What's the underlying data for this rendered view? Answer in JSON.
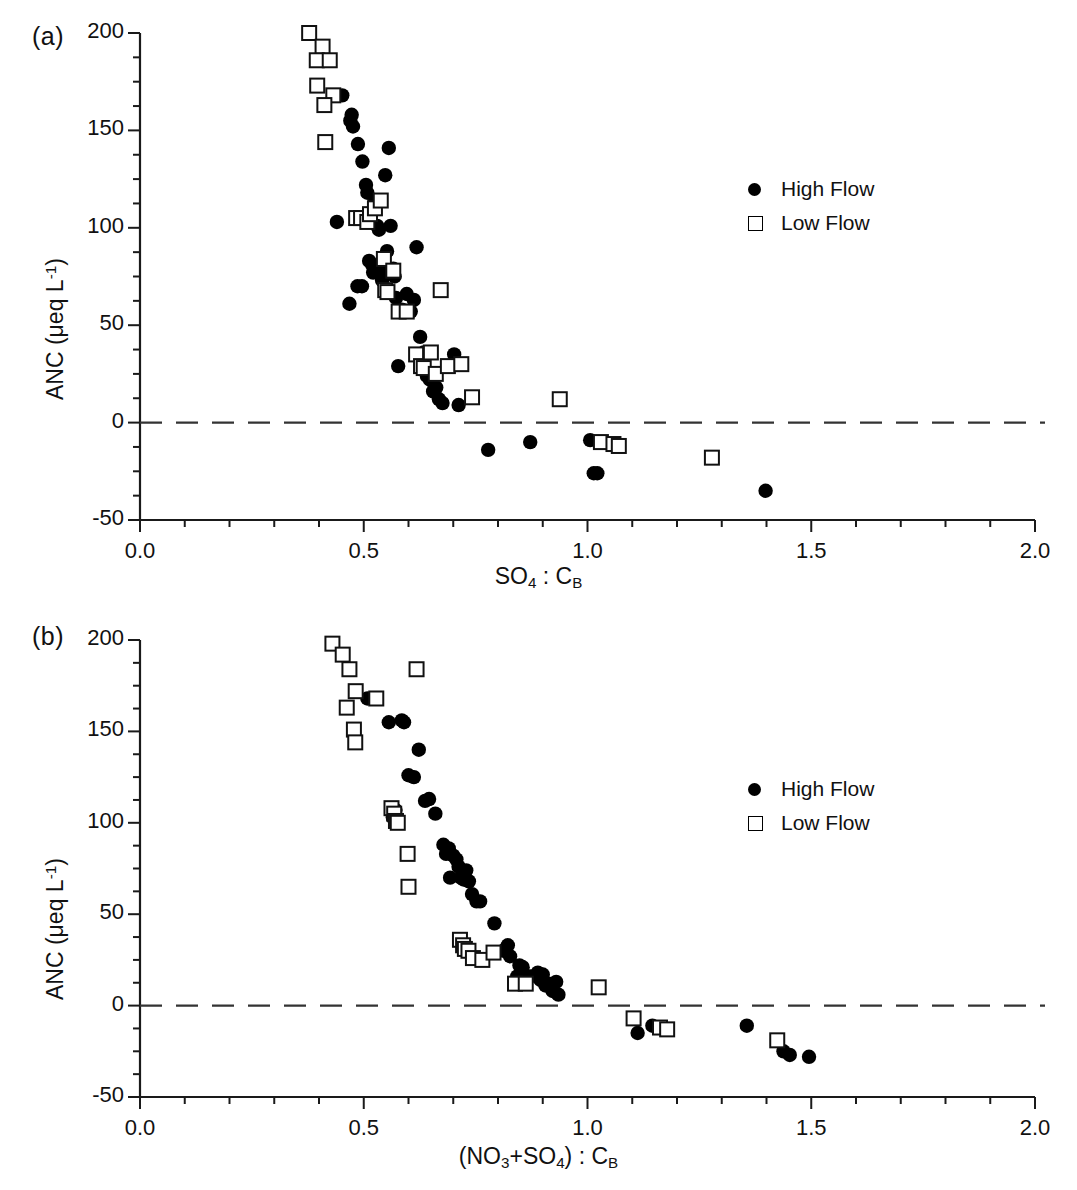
{
  "figure": {
    "background_color": "#ffffff",
    "marker_color": "#000000",
    "zero_line_style": "dashed"
  },
  "panels": [
    {
      "id": "a",
      "label": "(a)",
      "xlabel_html": "SO<sub>4</sub> : C<sub>B</sub>",
      "ylabel_html": "ANC (&#956;eq L<sup>-1</sup>)",
      "legend": [
        {
          "marker": "filled-circle",
          "label": "High Flow"
        },
        {
          "marker": "open-square",
          "label": "Low Flow"
        }
      ],
      "xticks": [
        "0.0",
        "0.5",
        "1.0",
        "1.5",
        "2.0"
      ],
      "yticks": [
        "200",
        "150",
        "100",
        "50",
        "0",
        "-50"
      ]
    },
    {
      "id": "b",
      "label": "(b)",
      "xlabel_html": "(NO<sub>3</sub>+SO<sub>4</sub>) : C<sub>B</sub>",
      "ylabel_html": "ANC (&#956;eq L<sup>-1</sup>)",
      "legend": [
        {
          "marker": "filled-circle",
          "label": "High Flow"
        },
        {
          "marker": "open-square",
          "label": "Low Flow"
        }
      ],
      "xticks": [
        "0.0",
        "0.5",
        "1.0",
        "1.5",
        "2.0"
      ],
      "yticks": [
        "200",
        "150",
        "100",
        "50",
        "0",
        "-50"
      ]
    }
  ],
  "chart_data": [
    {
      "type": "scatter",
      "panel": "a",
      "title": "",
      "xlabel": "SO4 : CB",
      "ylabel": "ANC (ueq L-1)",
      "xlim": [
        0.0,
        2.0
      ],
      "ylim": [
        -50,
        200
      ],
      "xticks": [
        0.0,
        0.5,
        1.0,
        1.5,
        2.0
      ],
      "yticks": [
        -50,
        0,
        50,
        100,
        150,
        200
      ],
      "minor_tick_step_x": 0.1,
      "minor_tick_step_y": 12.5,
      "grid": false,
      "legend_position": "right-upper",
      "zero_reference_line": {
        "y": 0,
        "style": "dashed"
      },
      "series": [
        {
          "name": "High Flow",
          "marker": "filled-circle",
          "points": [
            [
              0.44,
              103
            ],
            [
              0.452,
              168
            ],
            [
              0.47,
              155
            ],
            [
              0.473,
              158
            ],
            [
              0.476,
              152
            ],
            [
              0.468,
              61
            ],
            [
              0.487,
              143
            ],
            [
              0.497,
              134
            ],
            [
              0.496,
              70
            ],
            [
              0.486,
              70
            ],
            [
              0.505,
              122
            ],
            [
              0.508,
              118
            ],
            [
              0.512,
              83
            ],
            [
              0.519,
              81
            ],
            [
              0.521,
              77
            ],
            [
              0.524,
              113
            ],
            [
              0.53,
              101
            ],
            [
              0.534,
              99
            ],
            [
              0.538,
              81
            ],
            [
              0.541,
              73
            ],
            [
              0.545,
              76
            ],
            [
              0.548,
              127
            ],
            [
              0.552,
              88
            ],
            [
              0.556,
              141
            ],
            [
              0.56,
              101
            ],
            [
              0.566,
              79
            ],
            [
              0.569,
              75
            ],
            [
              0.572,
              64
            ],
            [
              0.577,
              29
            ],
            [
              0.585,
              58
            ],
            [
              0.596,
              66
            ],
            [
              0.605,
              57
            ],
            [
              0.612,
              63
            ],
            [
              0.618,
              90
            ],
            [
              0.626,
              44
            ],
            [
              0.634,
              36
            ],
            [
              0.641,
              24
            ],
            [
              0.648,
              22
            ],
            [
              0.655,
              16
            ],
            [
              0.662,
              18
            ],
            [
              0.668,
              12
            ],
            [
              0.676,
              10
            ],
            [
              0.702,
              35
            ],
            [
              0.712,
              9
            ],
            [
              0.778,
              -14
            ],
            [
              0.872,
              -10
            ],
            [
              1.006,
              -9
            ],
            [
              1.014,
              -26
            ],
            [
              1.022,
              -26
            ],
            [
              1.398,
              -35
            ]
          ]
        },
        {
          "name": "Low Flow",
          "marker": "open-square",
          "points": [
            [
              0.378,
              200
            ],
            [
              0.408,
              193
            ],
            [
              0.395,
              186
            ],
            [
              0.424,
              186
            ],
            [
              0.396,
              173
            ],
            [
              0.432,
              168
            ],
            [
              0.412,
              163
            ],
            [
              0.414,
              144
            ],
            [
              0.483,
              105
            ],
            [
              0.494,
              105
            ],
            [
              0.508,
              103
            ],
            [
              0.514,
              107
            ],
            [
              0.525,
              110
            ],
            [
              0.538,
              114
            ],
            [
              0.545,
              84
            ],
            [
              0.548,
              68
            ],
            [
              0.553,
              67
            ],
            [
              0.566,
              78
            ],
            [
              0.578,
              57
            ],
            [
              0.596,
              57
            ],
            [
              0.617,
              35
            ],
            [
              0.628,
              29
            ],
            [
              0.634,
              28
            ],
            [
              0.65,
              36
            ],
            [
              0.661,
              25
            ],
            [
              0.672,
              68
            ],
            [
              0.688,
              29
            ],
            [
              0.718,
              30
            ],
            [
              0.742,
              13
            ],
            [
              0.938,
              12
            ],
            [
              1.03,
              -10
            ],
            [
              1.058,
              -11
            ],
            [
              1.07,
              -12
            ],
            [
              1.278,
              -18
            ]
          ]
        }
      ]
    },
    {
      "type": "scatter",
      "panel": "b",
      "title": "",
      "xlabel": "(NO3+SO4) : CB",
      "ylabel": "ANC (ueq L-1)",
      "xlim": [
        0.0,
        2.0
      ],
      "ylim": [
        -50,
        200
      ],
      "xticks": [
        0.0,
        0.5,
        1.0,
        1.5,
        2.0
      ],
      "yticks": [
        -50,
        0,
        50,
        100,
        150,
        200
      ],
      "minor_tick_step_x": 0.1,
      "minor_tick_step_y": 12.5,
      "grid": false,
      "legend_position": "right-upper",
      "zero_reference_line": {
        "y": 0,
        "style": "dashed"
      },
      "series": [
        {
          "name": "High Flow",
          "marker": "filled-circle",
          "points": [
            [
              0.508,
              168
            ],
            [
              0.556,
              155
            ],
            [
              0.565,
              103
            ],
            [
              0.571,
              107
            ],
            [
              0.585,
              156
            ],
            [
              0.59,
              155
            ],
            [
              0.6,
              126
            ],
            [
              0.612,
              125
            ],
            [
              0.623,
              140
            ],
            [
              0.637,
              112
            ],
            [
              0.646,
              113
            ],
            [
              0.66,
              105
            ],
            [
              0.678,
              88
            ],
            [
              0.684,
              83
            ],
            [
              0.69,
              86
            ],
            [
              0.693,
              70
            ],
            [
              0.7,
              82
            ],
            [
              0.707,
              80
            ],
            [
              0.712,
              76
            ],
            [
              0.717,
              70
            ],
            [
              0.723,
              69
            ],
            [
              0.729,
              74
            ],
            [
              0.735,
              68
            ],
            [
              0.742,
              61
            ],
            [
              0.752,
              57
            ],
            [
              0.76,
              57
            ],
            [
              0.792,
              45
            ],
            [
              0.812,
              30
            ],
            [
              0.822,
              33
            ],
            [
              0.827,
              27
            ],
            [
              0.848,
              22
            ],
            [
              0.855,
              21
            ],
            [
              0.843,
              16
            ],
            [
              0.872,
              16
            ],
            [
              0.889,
              18
            ],
            [
              0.895,
              14
            ],
            [
              0.9,
              17
            ],
            [
              0.906,
              11
            ],
            [
              0.913,
              12
            ],
            [
              0.922,
              8
            ],
            [
              0.93,
              13
            ],
            [
              0.935,
              6
            ],
            [
              1.112,
              -15
            ],
            [
              1.145,
              -11
            ],
            [
              1.356,
              -11
            ],
            [
              1.438,
              -25
            ],
            [
              1.452,
              -27
            ],
            [
              1.495,
              -28
            ]
          ]
        },
        {
          "name": "Low Flow",
          "marker": "open-square",
          "points": [
            [
              0.43,
              198
            ],
            [
              0.453,
              192
            ],
            [
              0.468,
              184
            ],
            [
              0.618,
              184
            ],
            [
              0.482,
              172
            ],
            [
              0.528,
              168
            ],
            [
              0.462,
              163
            ],
            [
              0.478,
              151
            ],
            [
              0.481,
              144
            ],
            [
              0.562,
              108
            ],
            [
              0.568,
              105
            ],
            [
              0.572,
              101
            ],
            [
              0.576,
              100
            ],
            [
              0.598,
              83
            ],
            [
              0.6,
              65
            ],
            [
              0.715,
              36
            ],
            [
              0.722,
              33
            ],
            [
              0.726,
              31
            ],
            [
              0.734,
              30
            ],
            [
              0.744,
              26
            ],
            [
              0.765,
              25
            ],
            [
              0.79,
              29
            ],
            [
              0.838,
              12
            ],
            [
              0.862,
              12
            ],
            [
              1.025,
              10
            ],
            [
              1.103,
              -7
            ],
            [
              1.162,
              -12
            ],
            [
              1.178,
              -13
            ],
            [
              1.424,
              -19
            ]
          ]
        }
      ]
    }
  ]
}
